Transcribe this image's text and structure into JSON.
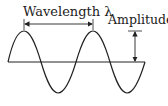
{
  "diagram": {
    "labels": {
      "wavelength": "Wavelength λ",
      "amplitude": "Amplitude"
    },
    "colors": {
      "stroke": "#222222",
      "background": "#ffffff"
    },
    "wave": {
      "cycles": 2,
      "baseline_y": 62,
      "amplitude_px": 31,
      "period_px": 69,
      "start_x": 7
    }
  }
}
